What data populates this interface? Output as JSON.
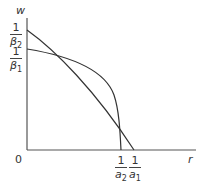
{
  "diagram": {
    "axes": {
      "y_label": "w",
      "x_label": "r",
      "origin_label": "0"
    },
    "y_ticks": [
      {
        "num": "1",
        "den": "β",
        "sub": "2"
      },
      {
        "num": "1",
        "den": "β",
        "sub": "1"
      }
    ],
    "x_ticks": [
      {
        "num": "1",
        "den": "a",
        "sub": "2"
      },
      {
        "num": "1",
        "den": "a",
        "sub": "1"
      }
    ],
    "curves": [
      {
        "name": "steep-curve",
        "from": "1/β2",
        "to": "1/a1",
        "shape": "near-linear, slightly concave"
      },
      {
        "name": "bulging-curve",
        "from": "1/β1",
        "to": "1/a2",
        "shape": "concave, bulging outward"
      }
    ],
    "colors": {
      "line": "#333333",
      "axis": "#555555",
      "background": "#ffffff"
    }
  }
}
